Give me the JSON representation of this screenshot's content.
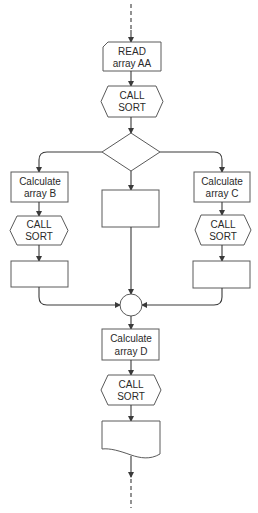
{
  "diagram": {
    "type": "flowchart",
    "nodes": {
      "read": {
        "shape": "card",
        "line1": "READ",
        "line2": "array AA"
      },
      "call_sort_1": {
        "shape": "hexagon",
        "line1": "CALL",
        "line2": "SORT"
      },
      "decision": {
        "shape": "diamond",
        "label": ""
      },
      "calc_b": {
        "shape": "process",
        "line1": "Calculate",
        "line2": "array B"
      },
      "call_sort_b": {
        "shape": "hexagon",
        "line1": "CALL",
        "line2": "SORT"
      },
      "empty_b": {
        "shape": "process",
        "label": ""
      },
      "empty_mid": {
        "shape": "process",
        "label": ""
      },
      "calc_c": {
        "shape": "process",
        "line1": "Calculate",
        "line2": "array C"
      },
      "call_sort_c": {
        "shape": "hexagon",
        "line1": "CALL",
        "line2": "SORT"
      },
      "empty_c": {
        "shape": "process",
        "label": ""
      },
      "connector": {
        "shape": "circle",
        "label": ""
      },
      "calc_d": {
        "shape": "process",
        "line1": "Calculate",
        "line2": "array D"
      },
      "call_sort_d": {
        "shape": "hexagon",
        "line1": "CALL",
        "line2": "SORT"
      },
      "output_doc": {
        "shape": "document",
        "label": ""
      }
    },
    "edges": [
      [
        "entry",
        "read"
      ],
      [
        "read",
        "call_sort_1"
      ],
      [
        "call_sort_1",
        "decision"
      ],
      [
        "decision",
        "calc_b"
      ],
      [
        "decision",
        "empty_mid"
      ],
      [
        "decision",
        "calc_c"
      ],
      [
        "calc_b",
        "call_sort_b"
      ],
      [
        "call_sort_b",
        "empty_b"
      ],
      [
        "calc_c",
        "call_sort_c"
      ],
      [
        "call_sort_c",
        "empty_c"
      ],
      [
        "empty_b",
        "connector"
      ],
      [
        "empty_mid",
        "connector"
      ],
      [
        "empty_c",
        "connector"
      ],
      [
        "connector",
        "calc_d"
      ],
      [
        "calc_d",
        "call_sort_d"
      ],
      [
        "call_sort_d",
        "output_doc"
      ],
      [
        "output_doc",
        "exit"
      ]
    ]
  }
}
